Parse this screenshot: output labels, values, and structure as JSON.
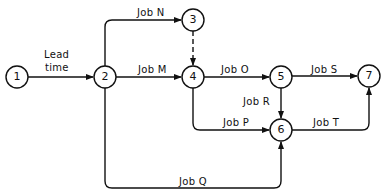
{
  "diagram": {
    "type": "activity-on-arrow network",
    "nodes": [
      {
        "id": "1",
        "label": "1",
        "x": 17,
        "y": 77
      },
      {
        "id": "2",
        "label": "2",
        "x": 105,
        "y": 77
      },
      {
        "id": "3",
        "label": "3",
        "x": 193,
        "y": 20
      },
      {
        "id": "4",
        "label": "4",
        "x": 193,
        "y": 77
      },
      {
        "id": "5",
        "label": "5",
        "x": 281,
        "y": 77
      },
      {
        "id": "6",
        "label": "6",
        "x": 281,
        "y": 130
      },
      {
        "id": "7",
        "label": "7",
        "x": 369,
        "y": 76
      }
    ],
    "edges": [
      {
        "from": "1",
        "to": "2",
        "label_line1": "Lead",
        "label_line2": "time"
      },
      {
        "from": "2",
        "to": "3",
        "label": "Job N"
      },
      {
        "from": "2",
        "to": "4",
        "label": "Job M"
      },
      {
        "from": "3",
        "to": "4",
        "label": "",
        "dashed": true
      },
      {
        "from": "4",
        "to": "5",
        "label": "Job O"
      },
      {
        "from": "5",
        "to": "7",
        "label": "Job S"
      },
      {
        "from": "5",
        "to": "6",
        "label": "Job R"
      },
      {
        "from": "4",
        "to": "6",
        "label": "Job P"
      },
      {
        "from": "6",
        "to": "7",
        "label": "Job T"
      },
      {
        "from": "2",
        "to": "6",
        "label": "Job Q"
      }
    ]
  }
}
